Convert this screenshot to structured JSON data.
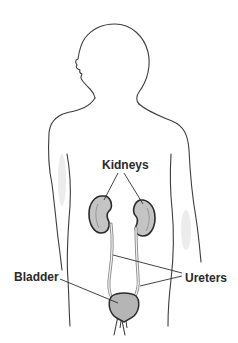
{
  "diagram": {
    "labels": {
      "kidneys": "Kidneys",
      "bladder": "Bladder",
      "ureters": "Ureters"
    },
    "colors": {
      "outline": "#3a3a3a",
      "organ_fill": "#bdbdbd",
      "shade": "#e6e6e6",
      "leader": "#2e2e2e"
    }
  }
}
